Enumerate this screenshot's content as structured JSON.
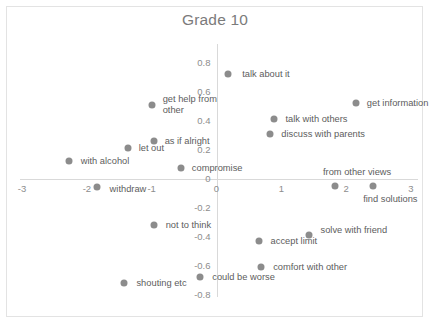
{
  "chart_data": {
    "type": "scatter",
    "title": "Grade 10",
    "xlabel": "",
    "ylabel": "",
    "xlim": [
      -3.3,
      3.3
    ],
    "ylim": [
      -0.85,
      0.85
    ],
    "grid": false,
    "legend": "none",
    "xticks": [
      "-3",
      "-2",
      "-1",
      "0",
      "1",
      "2",
      "3"
    ],
    "xtick_values": [
      -3,
      -2,
      -1,
      0,
      1,
      2,
      3
    ],
    "yticks": [
      "0.8",
      "0.6",
      "0.4",
      "0.2",
      "0",
      "-0.2",
      "-0.4",
      "-0.6",
      "-0.8"
    ],
    "ytick_values": [
      0.8,
      0.6,
      0.4,
      0.2,
      0,
      -0.2,
      -0.4,
      -0.6,
      -0.8
    ],
    "point_color": "#8c8c8c",
    "points": [
      {
        "label": "talk about it",
        "x": 0.18,
        "y": 0.72,
        "anchor": "left",
        "dx": 14,
        "dy": 0
      },
      {
        "label": "get help from\nother",
        "x": -1.0,
        "y": 0.51,
        "anchor": "left",
        "dx": 11,
        "dy": 0
      },
      {
        "label": "get information",
        "x": 2.15,
        "y": 0.52,
        "anchor": "left",
        "dx": 11,
        "dy": 0
      },
      {
        "label": "talk with others",
        "x": 0.88,
        "y": 0.41,
        "anchor": "left",
        "dx": 12,
        "dy": 0
      },
      {
        "label": "discuss with parents",
        "x": 0.83,
        "y": 0.31,
        "anchor": "left",
        "dx": 11,
        "dy": 0
      },
      {
        "label": "as if alright",
        "x": -0.97,
        "y": 0.26,
        "anchor": "left",
        "dx": 11,
        "dy": 0
      },
      {
        "label": "let out",
        "x": -1.37,
        "y": 0.21,
        "anchor": "left",
        "dx": 11,
        "dy": 0
      },
      {
        "label": "with alcohol",
        "x": -2.28,
        "y": 0.12,
        "anchor": "left",
        "dx": 12,
        "dy": 0
      },
      {
        "label": "compromise",
        "x": -0.55,
        "y": 0.07,
        "anchor": "left",
        "dx": 11,
        "dy": 0
      },
      {
        "label": "from other views",
        "x": 1.83,
        "y": -0.05,
        "anchor": "center",
        "dx": 22,
        "dy": -14
      },
      {
        "label": "find solutions",
        "x": 2.42,
        "y": -0.05,
        "anchor": "center",
        "dx": 17,
        "dy": 13
      },
      {
        "label": "withdraw",
        "x": -1.85,
        "y": -0.06,
        "anchor": "left",
        "dx": 13,
        "dy": 2
      },
      {
        "label": "not to think",
        "x": -0.97,
        "y": -0.32,
        "anchor": "left",
        "dx": 12,
        "dy": 0
      },
      {
        "label": "solve with friend",
        "x": 1.42,
        "y": -0.39,
        "anchor": "left",
        "dx": 12,
        "dy": -5
      },
      {
        "label": "accept limit",
        "x": 0.65,
        "y": -0.43,
        "anchor": "left",
        "dx": 12,
        "dy": 0
      },
      {
        "label": "comfort with other",
        "x": 0.69,
        "y": -0.61,
        "anchor": "left",
        "dx": 12,
        "dy": 0
      },
      {
        "label": "could be worse",
        "x": -0.25,
        "y": -0.68,
        "anchor": "left",
        "dx": 12,
        "dy": 0
      },
      {
        "label": "shouting etc",
        "x": -1.42,
        "y": -0.72,
        "anchor": "left",
        "dx": 12,
        "dy": 0
      }
    ]
  }
}
